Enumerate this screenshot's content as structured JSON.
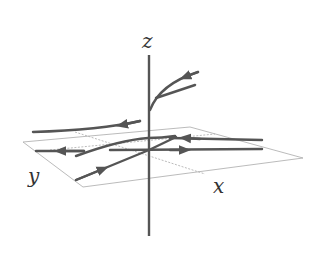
{
  "diagram": {
    "axes": {
      "z_label": "z",
      "x_label": "x",
      "y_label": "y"
    },
    "colors": {
      "axis": "#555555",
      "trajectory": "#555555",
      "plane": "#aaaaaa",
      "background": "#ffffff"
    }
  }
}
